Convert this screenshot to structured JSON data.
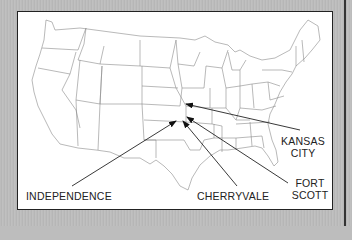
{
  "map": {
    "title": "United States",
    "locations": [
      {
        "name": "Independence",
        "label": "INDEPENDENCE"
      },
      {
        "name": "Cherryvale",
        "label": "CHERRYVALE"
      },
      {
        "name": "Fort Scott",
        "label_line1": "FORT",
        "label_line2": "SCOTT"
      },
      {
        "name": "Kansas City",
        "label_line1": "KANSAS",
        "label_line2": "CITY"
      }
    ],
    "colors": {
      "background": "#bdbdbd",
      "map_fill": "#ffffff",
      "borders": "#888888",
      "arrows": "#222222"
    }
  }
}
